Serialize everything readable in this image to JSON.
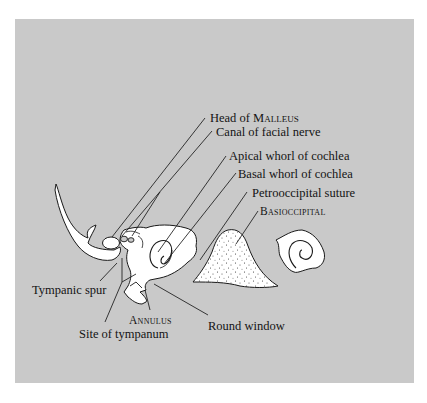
{
  "figure": {
    "background_color": "#ffffff",
    "panel_color": "#c9c9c9",
    "bone_fill": "#ffffff",
    "line_color": "#1a1a1a"
  },
  "labels": {
    "head_of_malleus": {
      "prefix": "Head of ",
      "sc": "Malleus"
    },
    "canal_facial_nerve": "Canal of facial nerve",
    "apical_whorl": "Apical whorl of cochlea",
    "basal_whorl": "Basal whorl of cochlea",
    "petrooccipital_suture": "Petrooccipital suture",
    "basioccipital": "Basioccipital",
    "tympanic_spur": "Tympanic spur",
    "annulus": "Annulus",
    "site_of_tympanum": "Site of tympanum",
    "round_window": "Round window"
  }
}
